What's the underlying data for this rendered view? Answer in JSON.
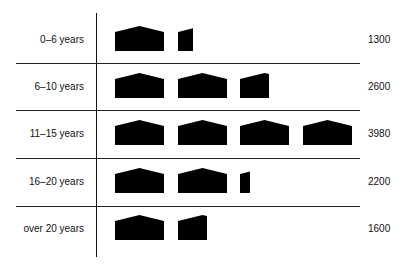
{
  "chart_data": {
    "type": "pictograph",
    "title": "",
    "icon": "house-icon",
    "units_per_icon": 1000,
    "categories": [
      "0–6 years",
      "6–10 years",
      "11–15 years",
      "16–20 years",
      "over 20 years"
    ],
    "values": [
      1300,
      2600,
      3980,
      2200,
      1600
    ],
    "value_labels": [
      "1300",
      "2600",
      "3980",
      "2200",
      "1600"
    ],
    "grid": "horizontal separators between rows",
    "legend": "none"
  },
  "rows": [
    {
      "label": "0–6 years",
      "value": "1300",
      "icons": [
        1,
        0.3
      ]
    },
    {
      "label": "6–10 years",
      "value": "2600",
      "icons": [
        1,
        1,
        0.6
      ]
    },
    {
      "label": "11–15 years",
      "value": "3980",
      "icons": [
        1,
        1,
        1,
        1
      ]
    },
    {
      "label": "16–20 years",
      "value": "2200",
      "icons": [
        1,
        1,
        0.2
      ]
    },
    {
      "label": "over 20 years",
      "value": "1600",
      "icons": [
        1,
        0.6
      ]
    }
  ]
}
